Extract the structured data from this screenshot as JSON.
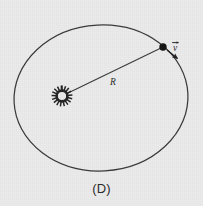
{
  "figure": {
    "caption": "(D)",
    "background_color": "#ebebeb",
    "ink_color": "#333333",
    "description_type": "orbit-diagram",
    "orbit": {
      "shape": "circle",
      "center_x": 101,
      "center_y": 98,
      "radius_x": 87,
      "radius_y": 73,
      "stroke_color": "#3a3a3a",
      "stroke_width": 1.2
    },
    "central_body": {
      "name": "star-sun",
      "cx": 62,
      "cy": 96,
      "core_radius": 5.2,
      "spike_count": 18,
      "spike_length": 5.4,
      "color": "#2a2a2a"
    },
    "orbiting_body": {
      "name": "planet",
      "cx": 163,
      "cy": 47,
      "radius": 3.6,
      "color": "#1a1a1a"
    },
    "radius_line": {
      "label": "R",
      "label_x": 110,
      "label_y": 84,
      "x1": 65,
      "y1": 94,
      "x2": 161,
      "y2": 48,
      "stroke_color": "#3a3a3a",
      "stroke_width": 1.1
    },
    "velocity_vector": {
      "label": "v",
      "label_overbar": true,
      "label_x": 175,
      "label_y": 46,
      "tail_x": 166,
      "tail_y": 50,
      "head_x": 179,
      "head_y": 60,
      "stroke_color": "#2a2a2a",
      "stroke_width": 1.2,
      "arrowhead": "filled-triangle"
    }
  }
}
